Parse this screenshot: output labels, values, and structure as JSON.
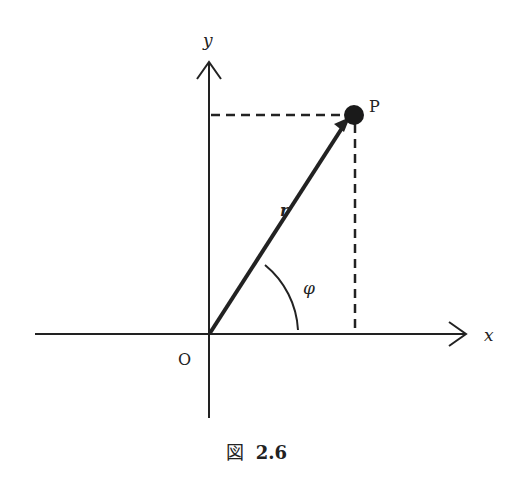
{
  "diagram": {
    "axes": {
      "x_label": "x",
      "y_label": "y",
      "origin_label": "O"
    },
    "point": {
      "label": "P"
    },
    "vector": {
      "label": "r"
    },
    "angle": {
      "label": "φ"
    },
    "colors": {
      "stroke": "#222222",
      "background": "#ffffff"
    }
  },
  "caption": {
    "prefix": "図",
    "number": "2.6"
  }
}
